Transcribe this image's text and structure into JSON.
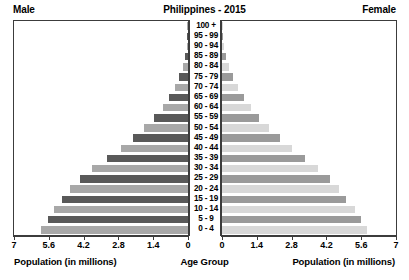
{
  "header": {
    "left_label": "Male",
    "title": "Philippines - 2015",
    "right_label": "Female"
  },
  "footer": {
    "left_caption": "Population (in millions)",
    "center_caption": "Age Group",
    "right_caption": "Population (in millions)"
  },
  "colors": {
    "male_dark": "#595959",
    "male_light": "#a8a8a8",
    "female_dark": "#9a9a9a",
    "female_light": "#d8d8d8",
    "frame": "#3c3c3c",
    "background": "#ffffff",
    "text": "#000000"
  },
  "chart_data": {
    "type": "bar",
    "title": "Philippines - 2015",
    "subtitle": "",
    "xlabel": "Population (in millions)",
    "ylabel": "Age Group",
    "xlim": [
      0,
      7
    ],
    "grid": false,
    "legend": [
      "Male",
      "Female"
    ],
    "legend_position": "top-corners",
    "orientation": "horizontal-diverging",
    "left_tick_labels": [
      "7",
      "5.6",
      "4.2",
      "2.8",
      "1.4",
      "0"
    ],
    "right_tick_labels": [
      "0",
      "1.4",
      "2.8",
      "4.2",
      "5.6",
      "7"
    ],
    "tick_values": [
      7,
      5.6,
      4.2,
      2.8,
      1.4,
      0
    ],
    "categories": [
      "100 +",
      "95 - 99",
      "90 - 94",
      "85 - 89",
      "80 - 84",
      "75 - 79",
      "70 - 74",
      "65 - 69",
      "60 - 64",
      "55 - 59",
      "50 - 54",
      "45 - 49",
      "40 - 44",
      "35 - 39",
      "30 - 34",
      "25 - 29",
      "20 - 24",
      "15 - 19",
      "10 - 14",
      "5 - 9",
      "0 - 4"
    ],
    "series": [
      {
        "name": "Male",
        "side": "left",
        "values": [
          0.01,
          0.02,
          0.05,
          0.12,
          0.22,
          0.36,
          0.52,
          0.75,
          1.02,
          1.36,
          1.76,
          2.2,
          2.7,
          3.25,
          3.85,
          4.35,
          4.75,
          5.05,
          5.4,
          5.65,
          5.9
        ]
      },
      {
        "name": "Female",
        "side": "right",
        "values": [
          0.02,
          0.04,
          0.09,
          0.18,
          0.3,
          0.46,
          0.64,
          0.88,
          1.16,
          1.5,
          1.9,
          2.32,
          2.8,
          3.32,
          3.88,
          4.35,
          4.7,
          5.0,
          5.35,
          5.6,
          5.85
        ]
      }
    ]
  }
}
